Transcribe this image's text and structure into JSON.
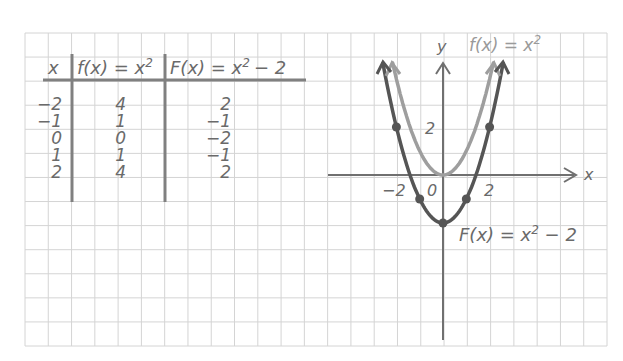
{
  "table": {
    "headers": [
      "x",
      "f(x) = x²",
      "F(x) = x² − 2"
    ],
    "header_parts": {
      "col0": "x",
      "col1_lhs": "f(x) = x",
      "col1_exp": "2",
      "col2_lhs": "F(x) = x",
      "col2_exp": "2",
      "col2_tail": "− 2"
    },
    "rows": [
      {
        "x": "−2",
        "f": "4",
        "F": "2"
      },
      {
        "x": "−1",
        "f": "1",
        "F": "−1"
      },
      {
        "x": "0",
        "f": "0",
        "F": "−2"
      },
      {
        "x": "1",
        "f": "1",
        "F": "−1"
      },
      {
        "x": "2",
        "f": "4",
        "F": "2"
      }
    ]
  },
  "graph": {
    "x_axis_label": "x",
    "y_axis_label": "y",
    "tick_labels": {
      "x_neg2": "−2",
      "x_0": "0",
      "x_2": "2",
      "y_2": "2"
    },
    "label_f": {
      "lhs": "f(x) = x",
      "exp": "2"
    },
    "label_F": {
      "lhs": "F(x) = x",
      "exp": "2",
      "tail": " − 2"
    },
    "colors": {
      "f_curve": "#9e9e9e",
      "F_curve": "#555555",
      "axes": "#707070",
      "grid": "#d4d4d4"
    }
  },
  "chart_data": {
    "type": "line",
    "title": "",
    "xlabel": "x",
    "ylabel": "y",
    "grid": true,
    "xlim": [
      -4.5,
      6.5
    ],
    "ylim": [
      -7,
      6
    ],
    "x": [
      -2,
      -1,
      0,
      1,
      2
    ],
    "series": [
      {
        "name": "f(x) = x^2",
        "values": [
          4,
          1,
          0,
          1,
          4
        ],
        "color": "#9e9e9e",
        "markers": false
      },
      {
        "name": "F(x) = x^2 - 2",
        "values": [
          2,
          -1,
          -2,
          -1,
          2
        ],
        "color": "#555555",
        "markers": true
      }
    ],
    "table": {
      "columns": [
        "x",
        "f(x) = x^2",
        "F(x) = x^2 - 2"
      ],
      "rows": [
        [
          -2,
          4,
          2
        ],
        [
          -1,
          1,
          -1
        ],
        [
          0,
          0,
          -2
        ],
        [
          1,
          1,
          -1
        ],
        [
          2,
          4,
          2
        ]
      ]
    },
    "annotations": [
      "f(x) = x^2",
      "F(x) = x^2 - 2"
    ]
  }
}
